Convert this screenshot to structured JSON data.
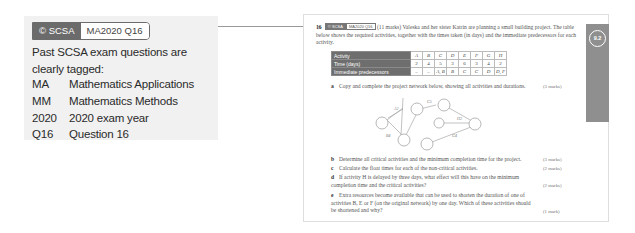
{
  "callout": {
    "tag_dark": "© SCSA",
    "tag_light": "MA2020 Q16",
    "intro": "Past SCSA exam questions are clearly tagged:",
    "legend": [
      {
        "key": "MA",
        "value": "Mathematics Applications"
      },
      {
        "key": "MM",
        "value": "Mathematics Methods"
      },
      {
        "key": "2020",
        "value": "2020 exam year"
      },
      {
        "key": "Q16",
        "value": "Question 16"
      }
    ]
  },
  "page": {
    "section_badge": "9.2",
    "question": {
      "number": "16",
      "tag_dark": "© SCSA",
      "tag_light": "MA2020 Q16",
      "marks": "(11 marks)",
      "text": "Valeska and her sister Katrin are planning a small building project. The table below shows the required activities, together with the times taken (in days) and the immediate predecessors for each activity."
    },
    "table": {
      "row_headers": [
        "Activity",
        "Time (days)",
        "Immediate predecessors"
      ],
      "activities": [
        "A",
        "B",
        "C",
        "D",
        "E",
        "F",
        "G",
        "H"
      ],
      "times": [
        "2",
        "4",
        "5",
        "3",
        "6",
        "3",
        "4",
        "2"
      ],
      "predecessors": [
        "–",
        "–",
        "A, B",
        "B",
        "C",
        "C",
        "D",
        "D, F"
      ]
    },
    "network": {
      "edge_labels": [
        "A2",
        "B4",
        "C5",
        "H2",
        "G4"
      ]
    },
    "parts": [
      {
        "letter": "a",
        "text": "Copy and complete the project network below, showing all activities and durations.",
        "marks": "(3 marks)"
      },
      {
        "letter": "b",
        "text": "Determine all critical activities and the minimum completion time for the project.",
        "marks": "(3 marks)"
      },
      {
        "letter": "c",
        "text": "Calculate the float times for each of the non-critical activities.",
        "marks": "(2 marks)"
      },
      {
        "letter": "d",
        "text": "If activity H is delayed by three days, what effect will this have on the minimum completion time and the critical activities?",
        "marks": "(2 marks)"
      },
      {
        "letter": "e",
        "text": "Extra resources become available that can be used to shorten the duration of one of activities B, E or F (on the original network) by one day. Which of these activities should be shortened and why?",
        "marks": "(1 mark)"
      }
    ]
  }
}
